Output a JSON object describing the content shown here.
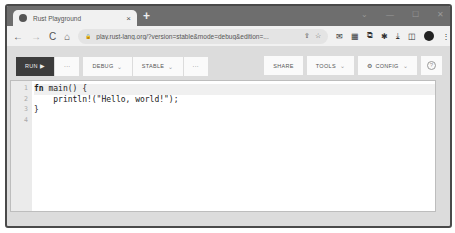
{
  "browser": {
    "tab_title": "Rust Playground",
    "tab_close": "×",
    "new_tab": "+",
    "window_controls": [
      "⌄",
      "—",
      "☐",
      "✕"
    ],
    "nav": {
      "back": "←",
      "forward": "→",
      "reload": "C",
      "home": "⌂"
    },
    "url": "play.rust-lang.org/?version=stable&mode=debug&edition=...",
    "lock_icon": "🔒",
    "share_icon": "⇪",
    "star_icon": "☆",
    "extension_icons": [
      "✉",
      "▦",
      "⧉",
      "✱",
      "⤓",
      "◫"
    ],
    "menu_icon": "⋮"
  },
  "toolbar": {
    "run_label": "RUN ▶",
    "run_more_label": "···",
    "debug_label": "DEBUG",
    "stable_label": "STABLE",
    "more_label": "···",
    "share_label": "SHARE",
    "tools_label": "TOOLS",
    "config_label": "CONFIG",
    "config_icon": "⚙",
    "help_icon": "?",
    "chevron": "⌄"
  },
  "editor": {
    "line_numbers": [
      "1",
      "2",
      "3",
      "4"
    ],
    "lines": [
      {
        "kw": "fn",
        "rest": " main() {"
      },
      {
        "kw": "",
        "rest": "    println!(\"Hello, world!\");"
      },
      {
        "kw": "",
        "rest": "}"
      },
      {
        "kw": "",
        "rest": ""
      }
    ]
  }
}
